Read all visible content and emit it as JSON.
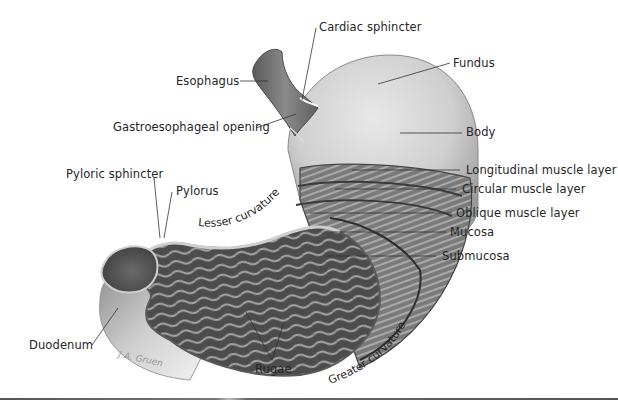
{
  "figure": {
    "signature": "J.A. Gruen"
  },
  "labels": {
    "cardiac_sphincter": "Cardiac sphincter",
    "fundus": "Fundus",
    "esophagus": "Esophagus",
    "gastroesophageal_opening": "Gastroesophageal opening",
    "body": "Body",
    "pyloric_sphincter": "Pyloric sphincter",
    "pylorus": "Pylorus",
    "longitudinal_muscle_layer": "Longitudinal muscle layer",
    "circular_muscle_layer": "Circular muscle layer",
    "lesser_curvature": "Lesser curvature",
    "oblique_muscle_layer": "Oblique muscle layer",
    "mucosa": "Mucosa",
    "submucosa": "Submucosa",
    "greater_curvature": "Greater curvature",
    "duodenum": "Duodenum",
    "rugae": "Rugae"
  },
  "colors": {
    "background": "#ffffff",
    "label_text": "#262626",
    "leader_line": "#333333",
    "outer_wall": "#c9c9c9",
    "muscle": "#6e6e6e",
    "interior": "#4a4a4a",
    "rugae_highlight": "#a8a8a8"
  }
}
